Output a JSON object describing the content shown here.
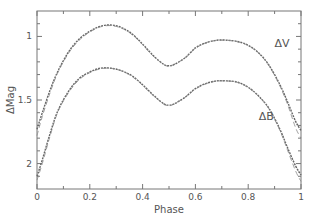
{
  "chart_data": {
    "type": "line",
    "title": "",
    "xlabel": "Phase",
    "ylabel": "ΔMag",
    "xlim": [
      0,
      1
    ],
    "ylim": [
      0.8,
      2.2
    ],
    "y_inverted": true,
    "grid": false,
    "legend": "none",
    "x_ticks_major": [
      0,
      0.2,
      0.4,
      0.6,
      0.8,
      1
    ],
    "x_tick_labels": [
      "0",
      "0.2",
      "0.4",
      "0.6",
      "0.8",
      "1"
    ],
    "x_ticks_minor": [
      0.1,
      0.3,
      0.5,
      0.7,
      0.9
    ],
    "y_ticks_major": [
      1,
      1.5,
      2
    ],
    "y_tick_labels": [
      "1",
      "1.5",
      "2"
    ],
    "y_ticks_minor": [
      0.9,
      1.1,
      1.2,
      1.3,
      1.4,
      1.6,
      1.7,
      1.8,
      1.9,
      2.1
    ],
    "series": [
      {
        "name": "ΔV",
        "label": "ΔV",
        "label_at": [
          0.9,
          1.08
        ],
        "x": [
          0,
          0.02,
          0.05,
          0.08,
          0.12,
          0.16,
          0.2,
          0.24,
          0.28,
          0.32,
          0.36,
          0.4,
          0.44,
          0.48,
          0.5,
          0.52,
          0.56,
          0.6,
          0.64,
          0.68,
          0.72,
          0.76,
          0.8,
          0.84,
          0.88,
          0.92,
          0.95,
          0.98,
          1
        ],
        "observed": [
          1.73,
          1.6,
          1.42,
          1.27,
          1.12,
          1.02,
          0.96,
          0.92,
          0.91,
          0.93,
          0.98,
          1.06,
          1.15,
          1.22,
          1.23,
          1.22,
          1.17,
          1.09,
          1.05,
          1.03,
          1.03,
          1.04,
          1.07,
          1.13,
          1.23,
          1.38,
          1.52,
          1.67,
          1.74
        ],
        "model": [
          1.78,
          1.63,
          1.44,
          1.28,
          1.13,
          1.03,
          0.965,
          0.925,
          0.915,
          0.935,
          0.985,
          1.065,
          1.155,
          1.22,
          1.235,
          1.22,
          1.17,
          1.095,
          1.05,
          1.032,
          1.03,
          1.042,
          1.072,
          1.132,
          1.235,
          1.39,
          1.54,
          1.72,
          1.8
        ]
      },
      {
        "name": "ΔB",
        "label": "ΔB",
        "label_at": [
          0.84,
          1.66
        ],
        "x": [
          0,
          0.02,
          0.05,
          0.08,
          0.12,
          0.16,
          0.2,
          0.24,
          0.28,
          0.32,
          0.36,
          0.4,
          0.44,
          0.48,
          0.5,
          0.52,
          0.56,
          0.6,
          0.64,
          0.68,
          0.72,
          0.76,
          0.8,
          0.84,
          0.88,
          0.92,
          0.95,
          0.98,
          1
        ],
        "observed": [
          2.1,
          1.97,
          1.76,
          1.58,
          1.43,
          1.33,
          1.28,
          1.25,
          1.25,
          1.27,
          1.31,
          1.38,
          1.46,
          1.53,
          1.54,
          1.53,
          1.48,
          1.41,
          1.37,
          1.35,
          1.35,
          1.36,
          1.4,
          1.47,
          1.57,
          1.73,
          1.88,
          2.02,
          2.09
        ],
        "model": [
          2.13,
          2.0,
          1.78,
          1.59,
          1.44,
          1.34,
          1.285,
          1.255,
          1.25,
          1.27,
          1.315,
          1.385,
          1.465,
          1.53,
          1.545,
          1.53,
          1.48,
          1.415,
          1.372,
          1.352,
          1.35,
          1.362,
          1.402,
          1.472,
          1.575,
          1.74,
          1.9,
          2.06,
          2.14
        ]
      }
    ]
  }
}
